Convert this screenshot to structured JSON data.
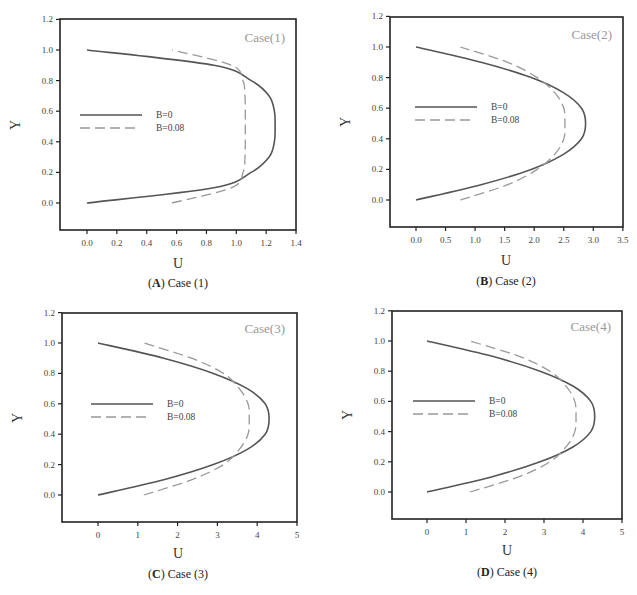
{
  "chart_data": [
    {
      "type": "line",
      "panel": "A",
      "caption_letter": "A",
      "caption_text": "Case (1)",
      "title": "Case(1)",
      "xlabel": "U",
      "ylabel": "Y",
      "xlim": [
        -0.17,
        1.4
      ],
      "ylim": [
        -0.18,
        1.2
      ],
      "xticks": [
        "0.0",
        "0.2",
        "0.4",
        "0.6",
        "0.8",
        "1.0",
        "1.2",
        "1.4"
      ],
      "yticks": [
        "0.0",
        "0.2",
        "0.4",
        "0.6",
        "0.8",
        "1.0",
        "1.2"
      ],
      "legend": [
        "B=0",
        "B=0.08"
      ],
      "legend_position": "center-left",
      "grid": false,
      "series": [
        {
          "name": "B=0",
          "style": "solid",
          "y": [
            0.0,
            0.1,
            0.2,
            0.3,
            0.4,
            0.5,
            0.6,
            0.7,
            0.8,
            0.9,
            1.0
          ],
          "x": [
            0.0,
            0.85,
            1.1,
            1.22,
            1.255,
            1.26,
            1.255,
            1.22,
            1.1,
            0.85,
            0.0
          ]
        },
        {
          "name": "B=0.08",
          "style": "dashed",
          "y": [
            0.0,
            0.1,
            0.2,
            0.3,
            0.4,
            0.5,
            0.6,
            0.7,
            0.8,
            0.9,
            1.0
          ],
          "x": [
            0.57,
            0.97,
            1.045,
            1.058,
            1.06,
            1.06,
            1.06,
            1.058,
            1.045,
            0.97,
            0.57
          ]
        }
      ]
    },
    {
      "type": "line",
      "panel": "B",
      "caption_letter": "B",
      "caption_text": "Case (2)",
      "title": "Case(2)",
      "xlabel": "U",
      "ylabel": "Y",
      "xlim": [
        -0.45,
        3.5
      ],
      "ylim": [
        -0.18,
        1.2
      ],
      "xticks": [
        "0.0",
        "0.5",
        "1.0",
        "1.5",
        "2.0",
        "2.5",
        "3.0",
        "3.5"
      ],
      "yticks": [
        "0.0",
        "0.2",
        "0.4",
        "0.6",
        "0.8",
        "1.0",
        "1.2"
      ],
      "legend": [
        "B=0",
        "B=0.08"
      ],
      "legend_position": "center-left",
      "grid": false,
      "series": [
        {
          "name": "B=0",
          "style": "solid",
          "y": [
            0.0,
            0.1,
            0.2,
            0.3,
            0.4,
            0.5,
            0.6,
            0.7,
            0.8,
            0.9,
            1.0
          ],
          "x": [
            0.0,
            1.1,
            1.95,
            2.5,
            2.8,
            2.87,
            2.8,
            2.5,
            1.95,
            1.1,
            0.0
          ]
        },
        {
          "name": "B=0.08",
          "style": "dashed",
          "y": [
            0.0,
            0.1,
            0.2,
            0.3,
            0.4,
            0.5,
            0.6,
            0.7,
            0.8,
            0.9,
            1.0
          ],
          "x": [
            0.75,
            1.55,
            2.05,
            2.35,
            2.5,
            2.52,
            2.5,
            2.35,
            2.05,
            1.55,
            0.75
          ]
        }
      ]
    },
    {
      "type": "line",
      "panel": "C",
      "caption_letter": "C",
      "caption_text": "Case (3)",
      "title": "Case(3)",
      "xlabel": "U",
      "ylabel": "Y",
      "xlim": [
        -0.9,
        5
      ],
      "ylim": [
        -0.18,
        1.2
      ],
      "xticks": [
        "0",
        "1",
        "2",
        "3",
        "4",
        "5"
      ],
      "yticks": [
        "0.0",
        "0.2",
        "0.4",
        "0.6",
        "0.8",
        "1.0",
        "1.2"
      ],
      "legend": [
        "B=0",
        "B=0.08"
      ],
      "legend_position": "center-left",
      "grid": false,
      "series": [
        {
          "name": "B=0",
          "style": "solid",
          "y": [
            0.0,
            0.1,
            0.2,
            0.3,
            0.4,
            0.5,
            0.6,
            0.7,
            0.8,
            0.9,
            1.0
          ],
          "x": [
            0.0,
            1.65,
            2.9,
            3.75,
            4.2,
            4.3,
            4.2,
            3.75,
            2.9,
            1.65,
            0.0
          ]
        },
        {
          "name": "B=0.08",
          "style": "dashed",
          "y": [
            0.0,
            0.1,
            0.2,
            0.3,
            0.4,
            0.5,
            0.6,
            0.7,
            0.8,
            0.9,
            1.0
          ],
          "x": [
            1.15,
            2.35,
            3.15,
            3.55,
            3.77,
            3.8,
            3.77,
            3.55,
            3.15,
            2.35,
            1.15
          ]
        }
      ]
    },
    {
      "type": "line",
      "panel": "D",
      "caption_letter": "D",
      "caption_text": "Case (4)",
      "title": "Case(4)",
      "xlabel": "U",
      "ylabel": "Y",
      "xlim": [
        -0.9,
        5
      ],
      "ylim": [
        -0.18,
        1.2
      ],
      "xticks": [
        "0",
        "1",
        "2",
        "3",
        "4",
        "5"
      ],
      "yticks": [
        "0.0",
        "0.2",
        "0.4",
        "0.6",
        "0.8",
        "1.0",
        "1.2"
      ],
      "legend": [
        "B=0",
        "B=0.08"
      ],
      "legend_position": "center-left",
      "grid": false,
      "series": [
        {
          "name": "B=0",
          "style": "solid",
          "y": [
            0.0,
            0.1,
            0.2,
            0.3,
            0.4,
            0.5,
            0.6,
            0.7,
            0.8,
            0.9,
            1.0
          ],
          "x": [
            0.0,
            1.65,
            2.9,
            3.75,
            4.2,
            4.3,
            4.2,
            3.75,
            2.9,
            1.65,
            0.0
          ]
        },
        {
          "name": "B=0.08",
          "style": "dashed",
          "y": [
            0.0,
            0.1,
            0.2,
            0.3,
            0.4,
            0.5,
            0.6,
            0.7,
            0.8,
            0.9,
            1.0
          ],
          "x": [
            1.1,
            2.35,
            3.15,
            3.57,
            3.79,
            3.82,
            3.79,
            3.57,
            3.15,
            2.35,
            1.1
          ]
        }
      ]
    }
  ],
  "colors": {
    "solid_line": "#555555",
    "dashed_line": "#999999",
    "frame": "#222222",
    "case_label": "#999999"
  }
}
